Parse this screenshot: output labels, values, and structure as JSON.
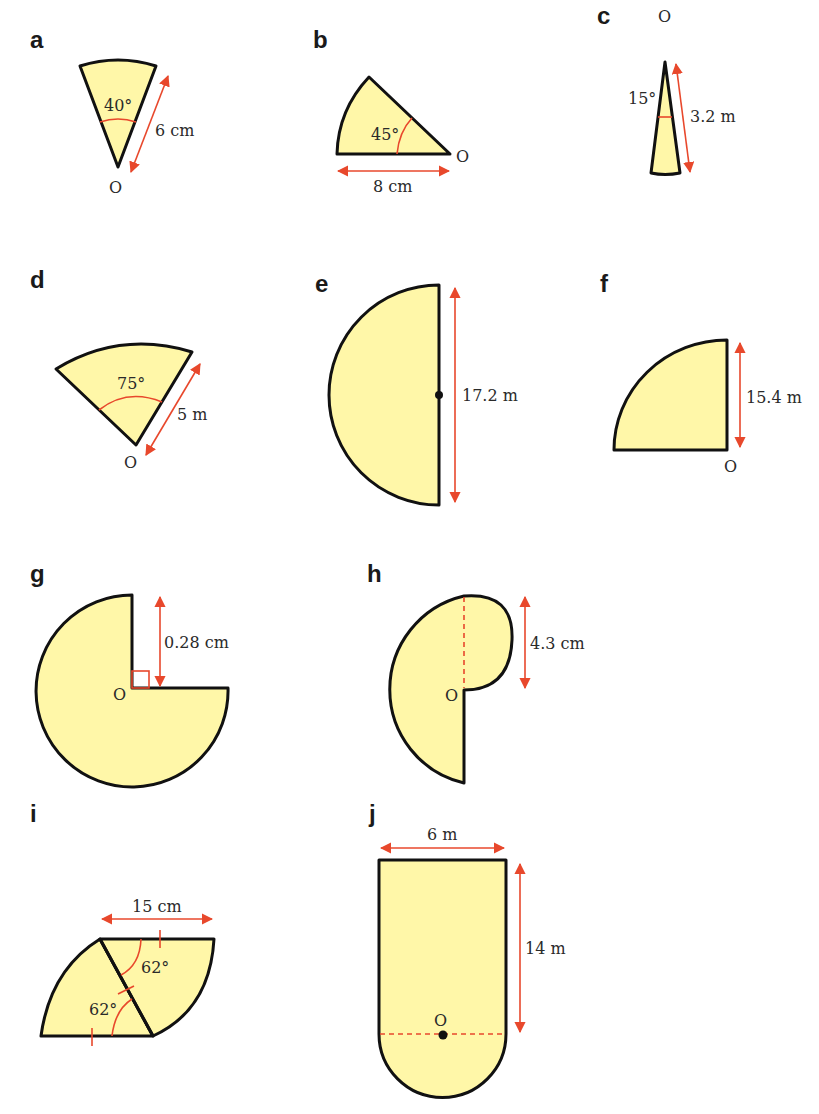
{
  "figures": [
    {
      "label": "a",
      "angle": "40°",
      "length": "6 cm",
      "center": "O",
      "type": "sector"
    },
    {
      "label": "b",
      "angle": "45°",
      "length": "8 cm",
      "center": "O",
      "type": "sector"
    },
    {
      "label": "c",
      "angle": "15°",
      "length": "3.2 m",
      "center": "O",
      "type": "sector"
    },
    {
      "label": "d",
      "angle": "75°",
      "length": "5 m",
      "center": "O",
      "type": "sector"
    },
    {
      "label": "e",
      "length": "17.2 m",
      "type": "semicircle"
    },
    {
      "label": "f",
      "length": "15.4 m",
      "center": "O",
      "type": "quarter-circle"
    },
    {
      "label": "g",
      "length": "0.28 cm",
      "center": "O",
      "type": "three-quarter-circle"
    },
    {
      "label": "h",
      "length": "4.3 cm",
      "center": "O",
      "type": "composite"
    },
    {
      "label": "i",
      "angle1": "62°",
      "angle2": "62°",
      "length": "15 cm",
      "type": "composite"
    },
    {
      "label": "j",
      "width": "6 m",
      "height": "14 m",
      "center": "O",
      "type": "composite"
    }
  ],
  "colors": {
    "fill": "#fff7a8",
    "outline": "#111111",
    "annotation": "#e8482c"
  }
}
